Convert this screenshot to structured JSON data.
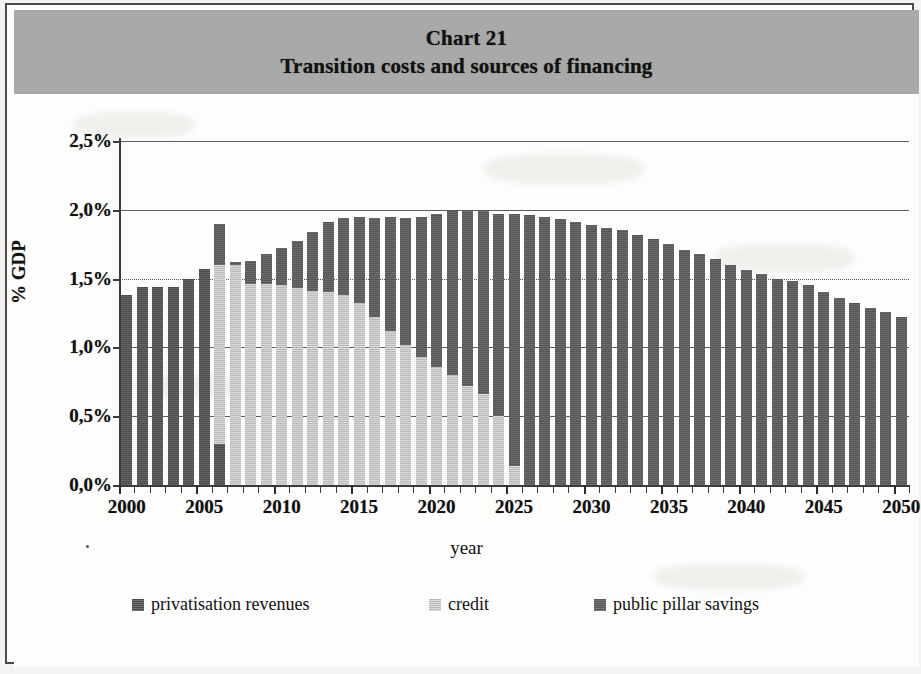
{
  "header": {
    "line1": "Chart 21",
    "line2": "Transition costs and sources of financing",
    "band_color": "#a9a9a9"
  },
  "axes": {
    "y_title": "% GDP",
    "x_title": "year",
    "y_ticks": [
      "0,0%",
      "0,5%",
      "1,0%",
      "1,5%",
      "2,0%",
      "2,5%"
    ],
    "x_ticks": [
      "2000",
      "2005",
      "2010",
      "2015",
      "2020",
      "2025",
      "2030",
      "2035",
      "2040",
      "2045",
      "2050"
    ]
  },
  "legend": {
    "items": [
      {
        "label": "privatisation revenues",
        "color": "#4c4c4c"
      },
      {
        "label": "credit",
        "color": "#b9b9b9"
      },
      {
        "label": "public pillar savings",
        "color": "#565656"
      }
    ]
  },
  "chart_data": {
    "type": "bar",
    "stacked": true,
    "title": "Transition costs and sources of financing",
    "subtitle": "Chart 21",
    "xlabel": "year",
    "ylabel": "% GDP",
    "ylim": [
      0.0,
      2.5
    ],
    "ytick_step": 0.5,
    "yunit": "percent of GDP",
    "grid": true,
    "legend_position": "bottom",
    "categories": [
      2000,
      2001,
      2002,
      2003,
      2004,
      2005,
      2006,
      2007,
      2008,
      2009,
      2010,
      2011,
      2012,
      2013,
      2014,
      2015,
      2016,
      2017,
      2018,
      2019,
      2020,
      2021,
      2022,
      2023,
      2024,
      2025,
      2026,
      2027,
      2028,
      2029,
      2030,
      2031,
      2032,
      2033,
      2034,
      2035,
      2036,
      2037,
      2038,
      2039,
      2040,
      2041,
      2042,
      2043,
      2044,
      2045,
      2046,
      2047,
      2048,
      2049,
      2050
    ],
    "series": [
      {
        "name": "privatisation revenues",
        "color": "#4c4c4c",
        "values": [
          1.38,
          1.44,
          1.44,
          1.44,
          1.5,
          1.57,
          0.3,
          0.0,
          0.0,
          0.0,
          0.0,
          0.0,
          0.0,
          0.0,
          0.0,
          0.0,
          0.0,
          0.0,
          0.0,
          0.0,
          0.0,
          0.0,
          0.0,
          0.0,
          0.0,
          0.0,
          0.0,
          0.0,
          0.0,
          0.0,
          0.0,
          0.0,
          0.0,
          0.0,
          0.0,
          0.0,
          0.0,
          0.0,
          0.0,
          0.0,
          0.0,
          0.0,
          0.0,
          0.0,
          0.0,
          0.0,
          0.0,
          0.0,
          0.0,
          0.0,
          0.0
        ]
      },
      {
        "name": "credit",
        "color": "#b9b9b9",
        "values": [
          0.0,
          0.0,
          0.0,
          0.0,
          0.0,
          0.0,
          1.3,
          1.6,
          1.46,
          1.46,
          1.45,
          1.43,
          1.41,
          1.4,
          1.38,
          1.32,
          1.22,
          1.12,
          1.02,
          0.93,
          0.86,
          0.8,
          0.72,
          0.66,
          0.5,
          0.14,
          0.0,
          0.0,
          0.0,
          0.0,
          0.0,
          0.0,
          0.0,
          0.0,
          0.0,
          0.0,
          0.0,
          0.0,
          0.0,
          0.0,
          0.0,
          0.0,
          0.0,
          0.0,
          0.0,
          0.0,
          0.0,
          0.0,
          0.0,
          0.0,
          0.0
        ]
      },
      {
        "name": "public pillar savings",
        "color": "#565656",
        "values": [
          0.0,
          0.0,
          0.0,
          0.0,
          0.0,
          0.0,
          0.3,
          0.02,
          0.17,
          0.22,
          0.27,
          0.34,
          0.43,
          0.51,
          0.56,
          0.63,
          0.72,
          0.83,
          0.92,
          1.02,
          1.11,
          1.19,
          1.27,
          1.33,
          1.47,
          1.83,
          1.96,
          1.95,
          1.93,
          1.91,
          1.89,
          1.87,
          1.85,
          1.82,
          1.79,
          1.75,
          1.71,
          1.68,
          1.64,
          1.6,
          1.56,
          1.53,
          1.5,
          1.48,
          1.45,
          1.4,
          1.36,
          1.32,
          1.29,
          1.26,
          1.22
        ]
      }
    ],
    "totals": [
      1.38,
      1.44,
      1.44,
      1.44,
      1.5,
      1.57,
      1.6,
      1.62,
      1.63,
      1.68,
      1.72,
      1.77,
      1.84,
      1.91,
      1.94,
      1.95,
      1.94,
      1.95,
      1.94,
      1.95,
      1.97,
      1.99,
      1.99,
      1.99,
      1.97,
      1.97,
      1.96,
      1.95,
      1.93,
      1.91,
      1.89,
      1.87,
      1.85,
      1.82,
      1.79,
      1.75,
      1.71,
      1.68,
      1.64,
      1.6,
      1.56,
      1.53,
      1.5,
      1.48,
      1.45,
      1.4,
      1.36,
      1.32,
      1.29,
      1.26,
      1.22
    ]
  }
}
